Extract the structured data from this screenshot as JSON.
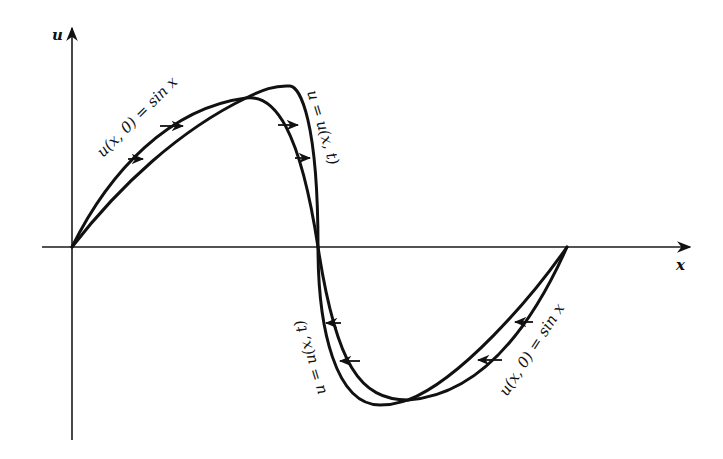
{
  "figure": {
    "axes": {
      "x_label": "x",
      "y_label": "u"
    },
    "labels": {
      "initial_upper": "u(x, 0) = sin x",
      "evolved_upper": "u = u(x, t)",
      "evolved_lower": "u = u(x, t)",
      "initial_lower": "u(x, 0) = sin x"
    },
    "curves": [
      {
        "name": "initial profile",
        "description": "u(x,0) = sin x over one period"
      },
      {
        "name": "evolved profile",
        "description": "u(x,t) steepened wave, crest shifted right, trough shifted left"
      }
    ],
    "arrows": {
      "upper_direction": "right",
      "lower_direction": "left",
      "count_upper": 4,
      "count_lower": 4
    },
    "colors": {
      "ink": "#111111",
      "background": "#ffffff"
    }
  }
}
